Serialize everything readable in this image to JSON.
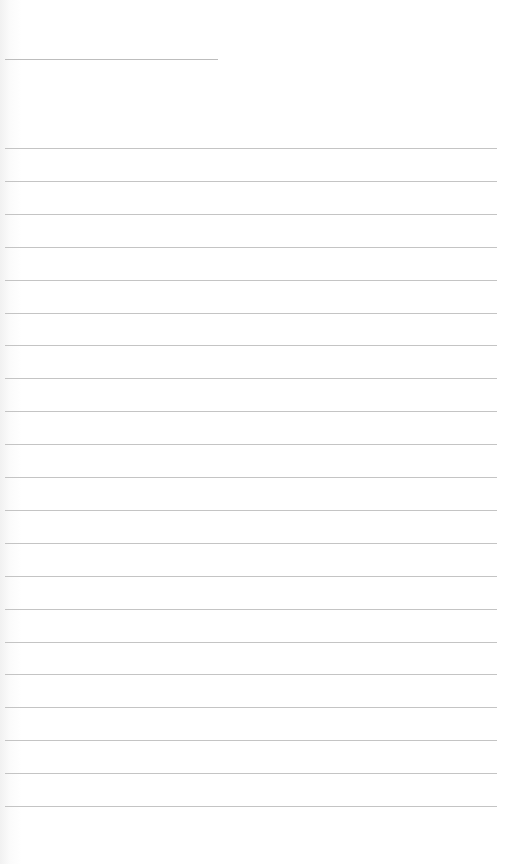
{
  "document": {
    "type": "blank lined notepaper",
    "background_color": "#ffffff",
    "line_color": "#c4c4c4",
    "header_line": {
      "present": true
    },
    "ruled_lines": {
      "count": 21,
      "first_y": 148,
      "spacing": 32.9,
      "entries": [
        "",
        "",
        "",
        "",
        "",
        "",
        "",
        "",
        "",
        "",
        "",
        "",
        "",
        "",
        "",
        "",
        "",
        "",
        "",
        "",
        ""
      ]
    }
  }
}
